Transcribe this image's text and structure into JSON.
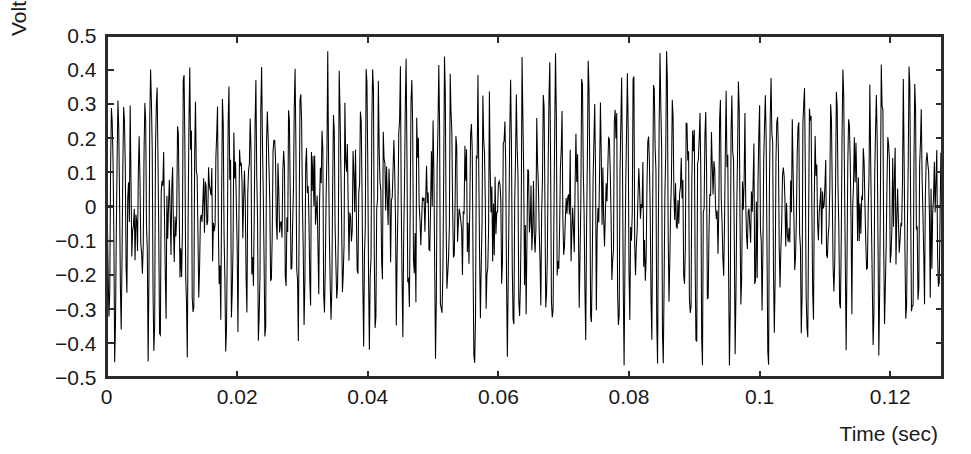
{
  "chart_data": {
    "type": "line",
    "title": "",
    "subtitle": "",
    "xlabel": "Time (sec)",
    "ylabel": "Voltage",
    "xlim": [
      0,
      0.128
    ],
    "ylim": [
      -0.5,
      0.5
    ],
    "grid": false,
    "legend": null,
    "zero_line": true,
    "series_name": "voltage-signal",
    "line_color": "#000000",
    "zero_line_color": "#9a9a9a",
    "axis_color": "#2b2b2b",
    "background_color": "#ffffff",
    "sample_rate_hz": 8000,
    "n_samples": 1024,
    "x_ticks": [
      0,
      0.02,
      0.04,
      0.06,
      0.08,
      0.1,
      0.12
    ],
    "x_tick_labels": [
      "0",
      "0.02",
      "0.04",
      "0.06",
      "0.08",
      "0.1",
      "0.12"
    ],
    "y_ticks": [
      -0.5,
      -0.4,
      -0.3,
      -0.2,
      -0.1,
      0,
      0.1,
      0.2,
      0.3,
      0.4,
      0.5
    ],
    "y_tick_labels": [
      "−0.5",
      "−0.4",
      "−0.3",
      "−0.2",
      "−0.1",
      "0",
      "0.1",
      "0.2",
      "0.3",
      "0.4",
      "0.5"
    ],
    "observed_max": 0.42,
    "observed_min": -0.43,
    "generator": {
      "components": [
        {
          "amplitude": 0.2,
          "frequency_hz": 1000
        },
        {
          "amplitude": 0.18,
          "frequency_hz": 1180
        },
        {
          "amplitude": 0.055,
          "frequency_hz": 2350
        }
      ],
      "noise_amplitude": 0.075,
      "noise_seed": 20250713
    }
  }
}
